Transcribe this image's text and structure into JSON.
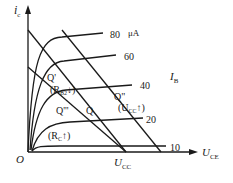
{
  "diagram": {
    "type": "transistor-output-characteristics-load-lines",
    "axes": {
      "y_label": "i",
      "y_sub": "c",
      "x_label": "U",
      "x_sub": "CE",
      "origin": "O",
      "x_tick": "U",
      "x_tick_sub": "CC"
    },
    "curve_family_label": "I",
    "curve_family_sub": "B",
    "curves": [
      {
        "ib": "80",
        "unit": "μA",
        "y": 36
      },
      {
        "ib": "60",
        "unit": "",
        "y": 58
      },
      {
        "ib": "40",
        "unit": "",
        "y": 84
      },
      {
        "ib": "20",
        "unit": "",
        "y": 118
      },
      {
        "ib": "10",
        "unit": "",
        "y": 147
      }
    ],
    "points": [
      {
        "name": "Q'",
        "note": "(R_B2↓)"
      },
      {
        "name": "Q\"",
        "note": "(U_CC↑)"
      },
      {
        "name": "Q'''",
        "note": ""
      },
      {
        "name": "Q",
        "note": ""
      },
      {
        "name": "(R_C↑)",
        "note": ""
      }
    ],
    "text": {
      "q1": "Q'",
      "q1_note_pre": "(R",
      "q1_note_sub": "B2",
      "q1_note_post": "↓)",
      "q2": "Q\"",
      "q2_note_pre": "(U",
      "q2_note_sub": "CC",
      "q2_note_post": "↑)",
      "q3": "Q'''",
      "q": "Q",
      "rc_pre": "(R",
      "rc_sub": "C",
      "rc_post": "↑)",
      "l80": "80",
      "unit": "μA",
      "l60": "60",
      "l40": "40",
      "l20": "20",
      "l10": "10"
    }
  }
}
